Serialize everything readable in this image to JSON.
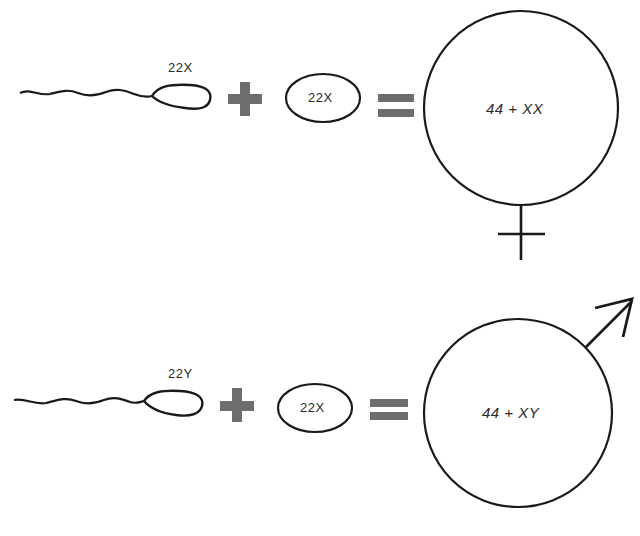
{
  "diagram": {
    "colors": {
      "line": "#1a1a1a",
      "operator": "#6e6e6e",
      "background": "#ffffff"
    },
    "rows": [
      {
        "id": "female",
        "sperm": {
          "label": "22X",
          "icon": "sperm-icon"
        },
        "plus": {
          "icon": "plus-icon"
        },
        "egg": {
          "label": "22X",
          "icon": "egg-icon"
        },
        "equals": {
          "icon": "equals-icon"
        },
        "result": {
          "label": "44 + XX",
          "symbol": "female-symbol-icon"
        }
      },
      {
        "id": "male",
        "sperm": {
          "label": "22Y",
          "icon": "sperm-icon"
        },
        "plus": {
          "icon": "plus-icon"
        },
        "egg": {
          "label": "22X",
          "icon": "egg-icon"
        },
        "equals": {
          "icon": "equals-icon"
        },
        "result": {
          "label": "44 + XY",
          "symbol": "male-symbol-icon"
        }
      }
    ]
  }
}
